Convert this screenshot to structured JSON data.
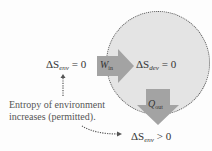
{
  "diagram": {
    "title": "",
    "colors": {
      "background": "#fdfdfd",
      "device_circle_fill": "#e4e4e4",
      "device_circle_border": "#555555",
      "arrow_fill": "#a3a3a3",
      "text": "#333333"
    },
    "device": {
      "shape": "dotted-circle",
      "equation": {
        "symbol": "ΔS",
        "subscript": "dev",
        "relation": "= 0"
      }
    },
    "environment_left": {
      "equation": {
        "symbol": "ΔS",
        "subscript": "env",
        "relation": "= 0"
      }
    },
    "environment_bottom": {
      "equation": {
        "symbol": "ΔS",
        "subscript": "env",
        "relation": "> 0"
      }
    },
    "work_arrow": {
      "symbol": "W",
      "subscript": "in",
      "direction": "right"
    },
    "heat_arrow": {
      "symbol": "Q",
      "subscript": "out",
      "direction": "down"
    },
    "annotation": {
      "line1": "Entropy of environment",
      "line2": "increases (permitted)."
    }
  }
}
